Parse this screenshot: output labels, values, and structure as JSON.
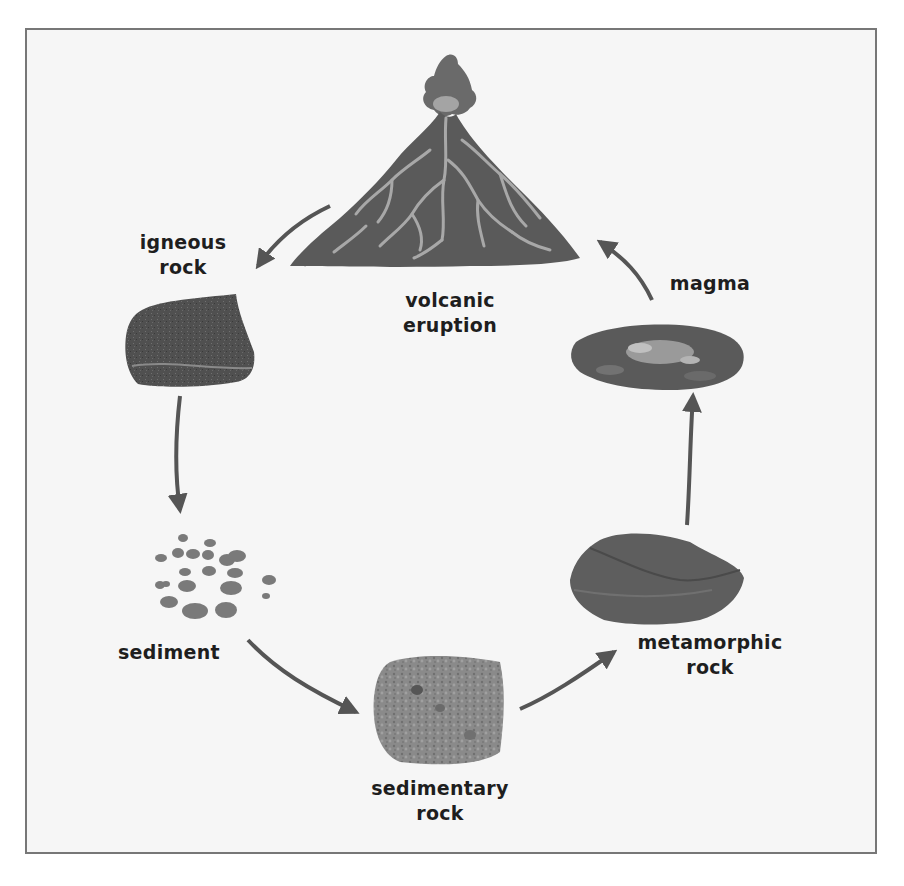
{
  "diagram": {
    "type": "cycle",
    "topic": "rock cycle",
    "colors": {
      "background": "#f6f6f6",
      "frame_border": "#777777",
      "arrow": "#555555",
      "label_text": "#1e1e1e",
      "volcano": "#5a5a5a",
      "lava_veins": "#a8a8a8"
    },
    "stages": [
      {
        "id": "volcanic-eruption",
        "label_line1": "volcanic",
        "label_line2": "eruption",
        "icon": "volcano-icon"
      },
      {
        "id": "magma",
        "label_line1": "magma",
        "label_line2": "",
        "icon": "magma-icon"
      },
      {
        "id": "metamorphic-rock",
        "label_line1": "metamorphic",
        "label_line2": "rock",
        "icon": "metamorphic-rock-icon"
      },
      {
        "id": "sedimentary-rock",
        "label_line1": "sedimentary",
        "label_line2": "rock",
        "icon": "sedimentary-rock-icon"
      },
      {
        "id": "sediment",
        "label_line1": "sediment",
        "label_line2": "",
        "icon": "sediment-icon"
      },
      {
        "id": "igneous-rock",
        "label_line1": "igneous",
        "label_line2": "rock",
        "icon": "igneous-rock-icon"
      }
    ],
    "arrows": [
      {
        "from": "volcanic-eruption",
        "to": "igneous-rock"
      },
      {
        "from": "igneous-rock",
        "to": "sediment"
      },
      {
        "from": "sediment",
        "to": "sedimentary-rock"
      },
      {
        "from": "sedimentary-rock",
        "to": "metamorphic-rock"
      },
      {
        "from": "metamorphic-rock",
        "to": "magma"
      },
      {
        "from": "magma",
        "to": "volcanic-eruption"
      }
    ]
  }
}
